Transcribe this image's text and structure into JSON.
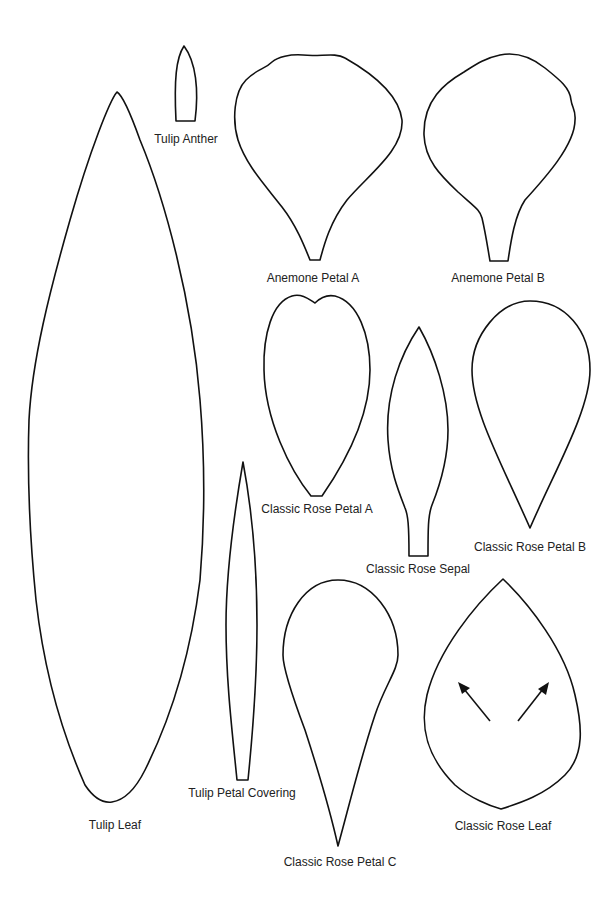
{
  "page": {
    "type": "paper flower template sheet",
    "line_color": "#111111",
    "background": "#ffffff"
  },
  "templates": {
    "tulip_anther": {
      "label": "Tulip Anther"
    },
    "anemone_petal_a": {
      "label": "Anemone Petal A"
    },
    "anemone_petal_b": {
      "label": "Anemone Petal B"
    },
    "tulip_leaf": {
      "label": "Tulip Leaf"
    },
    "classic_rose_petal_a": {
      "label": "Classic Rose Petal A"
    },
    "classic_rose_sepal": {
      "label": "Classic Rose Sepal"
    },
    "classic_rose_petal_b": {
      "label": "Classic Rose Petal B"
    },
    "tulip_petal_covering": {
      "label": "Tulip Petal Covering"
    },
    "classic_rose_petal_c": {
      "label": "Classic Rose Petal C"
    },
    "classic_rose_leaf": {
      "label": "Classic Rose Leaf",
      "annotation": "two outward arrows (fold/curl direction)"
    }
  }
}
